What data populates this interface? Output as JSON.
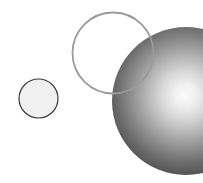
{
  "canvas": {
    "width": 203,
    "height": 183,
    "background_color": "#ffffff",
    "title": "Overlapping circles and shaded sphere"
  },
  "shapes": [
    {
      "name": "small-circle",
      "type": "circle",
      "label": "Small flat circle",
      "cx": 38.5,
      "cy": 98.5,
      "r": 19.5,
      "fill": "#f0f0f0",
      "stroke": "#3a3a3a",
      "stroke_width": 1.2,
      "style": "flat"
    },
    {
      "name": "large-ring",
      "type": "circle-outline",
      "label": "Large unfilled ring",
      "cx": 113,
      "cy": 53,
      "r": 40.5,
      "fill": "none",
      "stroke": "#9a9a9a",
      "stroke_width": 1.8,
      "style": "outline"
    },
    {
      "name": "shaded-sphere",
      "type": "sphere",
      "label": "Shaded sphere with specular highlight",
      "cx": 186,
      "cy": 101,
      "r": 74,
      "fill_dark": "#2f2f2f",
      "fill_mid": "#6b6b6b",
      "fill_light": "#f2f2f2",
      "highlight_x": 185,
      "highlight_y": 95,
      "style": "radial-gradient"
    }
  ],
  "gradient": {
    "name": "sphere-shading",
    "stops": [
      {
        "offset": "0%",
        "color": "#fbfbfb"
      },
      {
        "offset": "10%",
        "color": "#f0f0f0"
      },
      {
        "offset": "22%",
        "color": "#d8d8d8"
      },
      {
        "offset": "36%",
        "color": "#b4b4b4"
      },
      {
        "offset": "50%",
        "color": "#8e8e8e"
      },
      {
        "offset": "64%",
        "color": "#6a6a6a"
      },
      {
        "offset": "78%",
        "color": "#4c4c4c"
      },
      {
        "offset": "90%",
        "color": "#3a3a3a"
      },
      {
        "offset": "100%",
        "color": "#303030"
      }
    ]
  },
  "z_order": [
    "small-circle",
    "shaded-sphere",
    "large-ring"
  ]
}
